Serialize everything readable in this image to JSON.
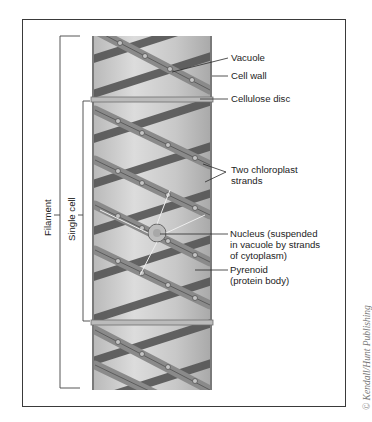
{
  "diagram": {
    "labels": {
      "vacuole": "Vacuole",
      "cell_wall": "Cell wall",
      "cellulose_disc": "Cellulose disc",
      "chloroplast_1": "Two chloroplast",
      "chloroplast_2": "strands",
      "nucleus_1": "Nucleus (suspended",
      "nucleus_2": "in vacuole by strands",
      "nucleus_3": "of cytoplasm)",
      "pyrenoid_1": "Pyrenoid",
      "pyrenoid_2": "(protein body)"
    },
    "brackets": {
      "filament": "Filament",
      "single_cell": "Single cell"
    },
    "credit": "© Kendall/Hunt Publishing"
  },
  "colors": {
    "frame": "#3a3a3a",
    "wall": "#8e8e8e",
    "cell_fill": "#cfcfcf",
    "strand_dark": "#5a5a5a",
    "strand_light": "#9a9a9a",
    "leader": "#2a2a2a"
  }
}
